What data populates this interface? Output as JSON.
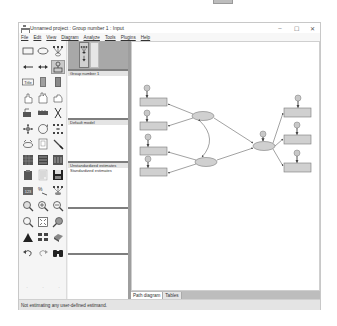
{
  "window": {
    "title": "Unnamed project : Group number 1 : Input",
    "controls": {
      "minimize": "–",
      "maximize": "☐",
      "close": "✕"
    }
  },
  "menu": {
    "items": [
      {
        "label": "File"
      },
      {
        "label": "Edit"
      },
      {
        "label": "View"
      },
      {
        "label": "Diagram"
      },
      {
        "label": "Analyze"
      },
      {
        "label": "Tools"
      },
      {
        "label": "Plugins"
      },
      {
        "label": "Help"
      }
    ]
  },
  "toolbox": {
    "tools": [
      {
        "name": "draw-observed-variable-icon"
      },
      {
        "name": "draw-unobserved-variable-icon"
      },
      {
        "name": "draw-latent-indicator-icon"
      },
      {
        "name": "draw-path-icon"
      },
      {
        "name": "draw-covariance-icon"
      },
      {
        "name": "add-unique-variable-icon"
      },
      {
        "name": "figure-caption-icon"
      },
      {
        "name": "list-variables-in-model-icon"
      },
      {
        "name": "list-variables-in-dataset-icon"
      },
      {
        "name": "select-one-object-icon"
      },
      {
        "name": "select-all-objects-icon"
      },
      {
        "name": "deselect-all-objects-icon"
      },
      {
        "name": "duplicate-objects-icon"
      },
      {
        "name": "move-objects-icon"
      },
      {
        "name": "erase-objects-icon"
      },
      {
        "name": "change-shape-icon"
      },
      {
        "name": "rotate-indicators-icon"
      },
      {
        "name": "reflect-indicators-icon"
      },
      {
        "name": "move-parameter-values-icon"
      },
      {
        "name": "scroll-diagram-icon"
      },
      {
        "name": "touch-up-icon"
      },
      {
        "name": "select-data-files-icon"
      },
      {
        "name": "analysis-properties-icon"
      },
      {
        "name": "calculate-estimates-icon"
      },
      {
        "name": "copy-to-clipboard-icon"
      },
      {
        "name": "view-text-icon"
      },
      {
        "name": "save-diagram-icon"
      },
      {
        "name": "object-properties-icon"
      },
      {
        "name": "drag-properties-icon"
      },
      {
        "name": "preserve-symmetries-icon"
      },
      {
        "name": "zoom-selected-area-icon"
      },
      {
        "name": "zoom-in-icon"
      },
      {
        "name": "zoom-out-icon"
      },
      {
        "name": "show-whole-page-icon"
      },
      {
        "name": "resize-to-fit-page-icon"
      },
      {
        "name": "magnifying-glass-icon"
      },
      {
        "name": "degrees-of-freedom-icon"
      },
      {
        "name": "multiple-group-analysis-icon"
      },
      {
        "name": "print-diagram-icon"
      },
      {
        "name": "undo-icon"
      },
      {
        "name": "redo-icon"
      },
      {
        "name": "specification-search-icon"
      }
    ],
    "dots": [
      "·",
      "·",
      "·"
    ]
  },
  "panels": {
    "groups": {
      "items": [
        "Group number 1"
      ]
    },
    "models": {
      "items": [
        "Default model"
      ]
    },
    "estimates": {
      "items": [
        "Unstandardized estimates",
        "Standardized estimates"
      ]
    }
  },
  "tabs": [
    {
      "label": "Path diagram",
      "active": true
    },
    {
      "label": "Tables",
      "active": false
    }
  ],
  "status": {
    "text": "Not estimating any user-defined estimand."
  },
  "colors": {
    "object_fill": "#d0d0d0",
    "object_stroke": "#7a7a7a",
    "error_fill": "#c8c8c8",
    "panel_divider": "#7e7e7e",
    "splitter": "#9e9e9e"
  },
  "diagram": {
    "observed_left": [
      {
        "x": 8,
        "y": 56
      },
      {
        "x": 8,
        "y": 80
      },
      {
        "x": 8,
        "y": 105
      },
      {
        "x": 8,
        "y": 126
      }
    ],
    "observed_right": [
      {
        "x": 152,
        "y": 66
      },
      {
        "x": 152,
        "y": 93
      },
      {
        "x": 152,
        "y": 121
      }
    ],
    "latents": [
      {
        "cx": 71,
        "cy": 74,
        "label": ""
      },
      {
        "cx": 74,
        "cy": 120,
        "label": ""
      },
      {
        "cx": 132,
        "cy": 104,
        "label": ""
      }
    ]
  }
}
